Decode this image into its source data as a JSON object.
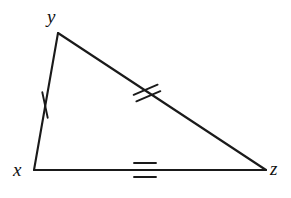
{
  "figure": {
    "kind": "geometry-diagram",
    "shape": "triangle",
    "background_color": "#ffffff",
    "stroke_color": "#1a1a1a",
    "stroke_width": 2.1,
    "label_color": "#111111",
    "canvas": {
      "width": 291,
      "height": 198
    },
    "vertices": [
      {
        "id": "y",
        "label": "y",
        "x": 58,
        "y": 33,
        "label_x": 52,
        "label_y": 16,
        "label_position": "above-left"
      },
      {
        "id": "x",
        "label": "x",
        "x": 34,
        "y": 170,
        "label_x": 20,
        "label_y": 171,
        "label_position": "left"
      },
      {
        "id": "z",
        "label": "z",
        "x": 266,
        "y": 170,
        "label_x": 276,
        "label_y": 170,
        "label_position": "right"
      }
    ],
    "sides": [
      {
        "id": "xy",
        "from": "x",
        "to": "y",
        "tick_count": 1,
        "tick_meaning": "single-congruence-mark",
        "tick_center": {
          "x": 45,
          "y": 105
        },
        "tick_angle_deg": 78,
        "tick_length": 26,
        "tick_spacing": 0
      },
      {
        "id": "yz",
        "from": "y",
        "to": "z",
        "tick_count": 2,
        "tick_meaning": "double-congruence-mark",
        "tick_center": {
          "x": 147,
          "y": 93
        },
        "tick_angle_deg": -23,
        "tick_length": 26,
        "tick_spacing": 7
      },
      {
        "id": "xz",
        "from": "x",
        "to": "z",
        "tick_count": 3,
        "tick_meaning": "triple-congruence-mark",
        "tick_center": {
          "x": 145,
          "y": 170
        },
        "tick_angle_deg": 0,
        "tick_length": 22,
        "tick_spacing": 7
      }
    ]
  }
}
